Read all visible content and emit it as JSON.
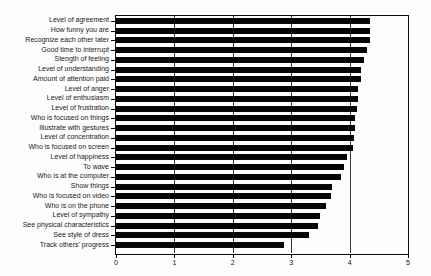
{
  "chart_data": {
    "type": "bar",
    "orientation": "horizontal",
    "title": "",
    "xlabel": "",
    "ylabel": "",
    "xlim": [
      0,
      5
    ],
    "x_ticks": [
      "0",
      "1",
      "2",
      "3",
      "4",
      "5"
    ],
    "gridlines_at": [
      1,
      2,
      3,
      4
    ],
    "grid": "vertical",
    "bar_color": "#050505",
    "categories": [
      "Level of agreement",
      "How funny you are",
      "Recognize each other later",
      "Good time to interrupt",
      "Stength of feeling",
      "Level of understanding",
      "Amount of attention paid",
      "Level of anger",
      "Level of enthusiasm",
      "Level of frustration",
      "Who is focused on things",
      "Illustrate with gestures",
      "Level of concentration",
      "Who is focused on screen",
      "Level of happiness",
      "To wave",
      "Who is at the computer",
      "Show things",
      "Who is focused on video",
      "Who is on the phone",
      "Level of sympathy",
      "See physical characteristics",
      "See style of dress",
      "Track others' progress"
    ],
    "values": [
      4.35,
      4.35,
      4.35,
      4.3,
      4.25,
      4.2,
      4.2,
      4.15,
      4.15,
      4.12,
      4.1,
      4.1,
      4.08,
      4.05,
      3.95,
      3.9,
      3.85,
      3.7,
      3.68,
      3.6,
      3.5,
      3.45,
      3.3,
      2.88
    ]
  }
}
